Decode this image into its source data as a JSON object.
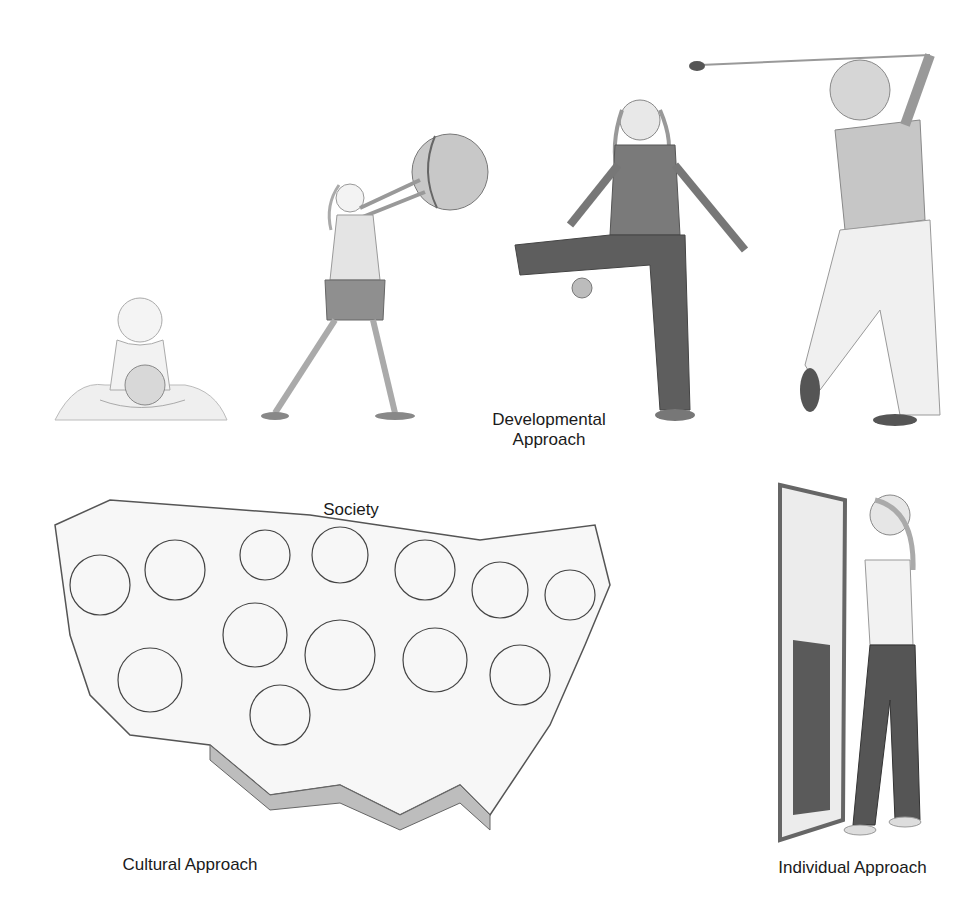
{
  "figure": {
    "panels": [
      {
        "id": "developmental",
        "label_lines": [
          "Developmental",
          "Approach"
        ],
        "stages": [
          "infant-with-ball",
          "child-throwing-ball",
          "adolescent-kicking-ball",
          "adult-golfing"
        ]
      },
      {
        "id": "cultural",
        "label": "Cultural Approach",
        "sublabel": "Society"
      },
      {
        "id": "individual",
        "label": "Individual Approach"
      }
    ]
  },
  "labels": {
    "developmental_line1": "Developmental",
    "developmental_line2": "Approach",
    "society": "Society",
    "cultural": "Cultural Approach",
    "individual": "Individual Approach"
  }
}
